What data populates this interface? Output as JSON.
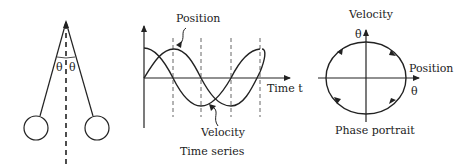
{
  "pendulum": {
    "angle_left_label": "θ",
    "angle_right_label": "θ"
  },
  "time_series": {
    "caption": "Time series",
    "x_axis_label": "Time t",
    "position_label": "Position",
    "velocity_label": "Velocity"
  },
  "phase_portrait": {
    "caption": "Phase portrait",
    "y_axis_title": "Velocity",
    "y_axis_symbol": "θ̇",
    "x_axis_title": "Position",
    "x_axis_symbol": "θ",
    "direction": "clockwise"
  },
  "colors": {
    "ink": "#222222",
    "background": "#ffffff"
  }
}
